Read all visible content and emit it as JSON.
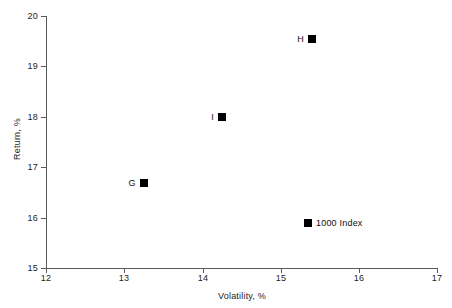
{
  "chart_data": {
    "type": "scatter",
    "title": "",
    "xlabel": "Volatility, %",
    "ylabel": "Return, %",
    "xlim": [
      12,
      17
    ],
    "ylim": [
      15,
      20
    ],
    "xticks": [
      "12",
      "13",
      "14",
      "15",
      "16",
      "17"
    ],
    "yticks": [
      "15",
      "16",
      "17",
      "18",
      "19",
      "20"
    ],
    "grid": false,
    "legend": "none",
    "points": [
      {
        "label": "H",
        "x": 15.4,
        "y": 19.55,
        "label_side": "left"
      },
      {
        "label": "I",
        "x": 14.25,
        "y": 18.0,
        "label_side": "left"
      },
      {
        "label": "G",
        "x": 13.25,
        "y": 16.68,
        "label_side": "left"
      },
      {
        "label": "1000 Index",
        "x": 15.35,
        "y": 15.9,
        "label_side": "right"
      }
    ]
  }
}
